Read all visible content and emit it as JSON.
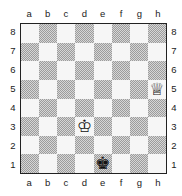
{
  "board": {
    "files": [
      "a",
      "b",
      "c",
      "d",
      "e",
      "f",
      "g",
      "h"
    ],
    "ranks": [
      "8",
      "7",
      "6",
      "5",
      "4",
      "3",
      "2",
      "1"
    ],
    "colors": {
      "light_square": "#f6f6f6",
      "dark_square": "#bdbdbd",
      "border": "#222222"
    },
    "pieces": [
      {
        "square": "h5",
        "piece": "queen",
        "color": "white",
        "glyph": "♕"
      },
      {
        "square": "d3",
        "piece": "king",
        "color": "white",
        "glyph": "♔"
      },
      {
        "square": "e1",
        "piece": "king",
        "color": "black",
        "glyph": "♚"
      }
    ]
  }
}
